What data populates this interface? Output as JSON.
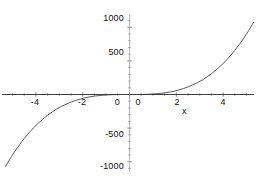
{
  "chart_data": {
    "type": "line",
    "title": "",
    "subtitle": "",
    "xlabel": "x",
    "ylabel": "",
    "xlim": [
      -5.5,
      5.4
    ],
    "ylim": [
      -1150,
      1150
    ],
    "grid": false,
    "legend": null,
    "annotations": [],
    "x_ticks": [
      {
        "value": -4,
        "label": "-4"
      },
      {
        "value": -2,
        "label": "-2"
      },
      {
        "value": 0,
        "label": "0"
      },
      {
        "value": 2,
        "label": "2"
      },
      {
        "value": 4,
        "label": "4"
      }
    ],
    "y_ticks": [
      {
        "value": 1000,
        "label": "1000"
      },
      {
        "value": 500,
        "label": "500"
      },
      {
        "value": 0,
        "label": "0"
      },
      {
        "value": -500,
        "label": "-500"
      },
      {
        "value": -1000,
        "label": "-1000"
      }
    ],
    "x_minor_tick_step": 0.5,
    "y_minor_tick_step": 100,
    "series": [
      {
        "name": "curve",
        "color": "#3c3c3c",
        "x": [
          -5.3,
          -5.1,
          -4.9,
          -4.7,
          -4.5,
          -4.3,
          -4.1,
          -3.9,
          -3.7,
          -3.5,
          -3.3,
          -3.1,
          -2.9,
          -2.7,
          -2.5,
          -2.3,
          -2.1,
          -1.9,
          -1.7,
          -1.5,
          -1.3,
          -1.1,
          -0.9,
          -0.7,
          -0.5,
          -0.3,
          -0.1,
          0,
          0.1,
          0.3,
          0.5,
          0.7,
          0.9,
          1.1,
          1.3,
          1.5,
          1.7,
          1.9,
          2.1,
          2.3,
          2.5,
          2.7,
          2.9,
          3.1,
          3.3,
          3.5,
          3.7,
          3.9,
          4.1,
          4.3,
          4.5,
          4.7,
          4.9,
          5.1,
          5.3
        ],
        "y": [
          -1072,
          -955,
          -847,
          -747,
          -656,
          -572,
          -496,
          -427,
          -365,
          -309,
          -259,
          -214,
          -176,
          -142,
          -113,
          -88,
          -67,
          -49,
          -35,
          -24,
          -16,
          -10,
          -5,
          -2,
          -1,
          0,
          0,
          0,
          0,
          0,
          1,
          2,
          5,
          10,
          16,
          24,
          35,
          49,
          67,
          88,
          113,
          142,
          176,
          214,
          259,
          309,
          365,
          427,
          496,
          572,
          656,
          747,
          847,
          955,
          1072
        ]
      }
    ]
  },
  "axis_labels": {
    "x_axis_name": "x",
    "origin_y_label": "0",
    "origin_x_label": "0"
  },
  "colors": {
    "curve": "#3c3c3c",
    "axis": "#2b2b2b",
    "tick": "#6b6b6b",
    "background": "#ffffff",
    "text": "#111111"
  }
}
